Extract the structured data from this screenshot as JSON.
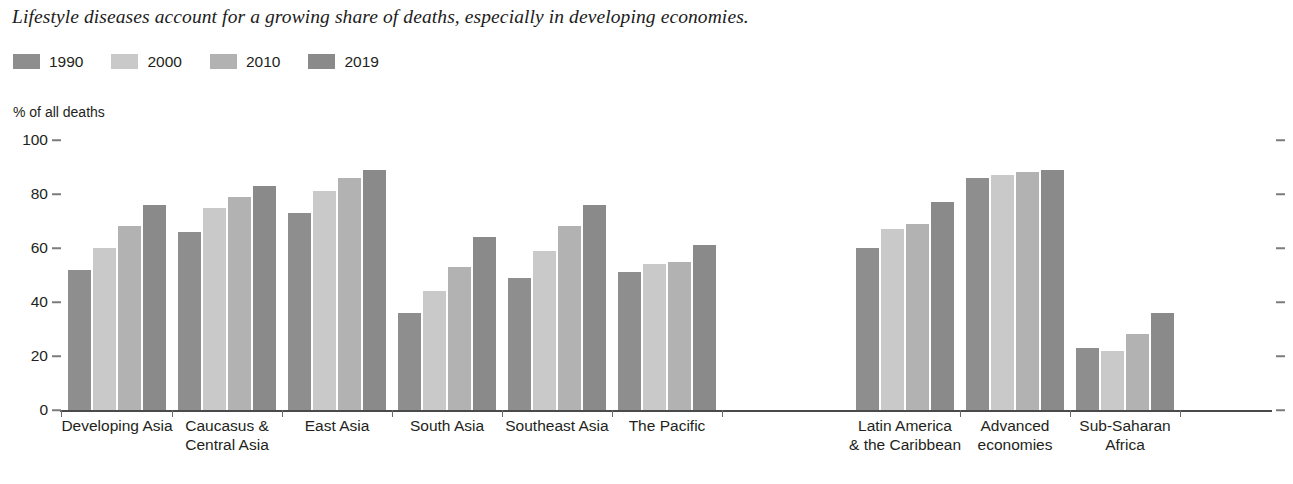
{
  "headline": "Lifestyle diseases account for a growing share of deaths, especially in developing economies.",
  "axis_title": "% of all deaths",
  "legend": {
    "items": [
      {
        "label": "1990",
        "color": "#8e8e8e"
      },
      {
        "label": "2000",
        "color": "#c9c9c9"
      },
      {
        "label": "2010",
        "color": "#b2b2b2"
      },
      {
        "label": "2019",
        "color": "#8a8a8a"
      }
    ]
  },
  "chart_data": {
    "type": "bar",
    "title": "Lifestyle diseases account for a growing share of deaths, especially in developing economies.",
    "xlabel": "",
    "ylabel": "% of all deaths",
    "ylim": [
      0,
      100
    ],
    "yticks": [
      0,
      20,
      40,
      60,
      80,
      100
    ],
    "grid": false,
    "legend_position": "top-left",
    "categories": [
      "Developing Asia",
      "Caucasus &\nCentral Asia",
      "East Asia",
      "South Asia",
      "Southeast Asia",
      "The Pacific",
      "Latin America\n& the Caribbean",
      "Advanced\neconomies",
      "Sub-Saharan\nAfrica"
    ],
    "category_lines": [
      [
        "Developing Asia"
      ],
      [
        "Caucasus &",
        "Central Asia"
      ],
      [
        "East Asia"
      ],
      [
        "South Asia"
      ],
      [
        "Southeast Asia"
      ],
      [
        "The Pacific"
      ],
      [
        "Latin America",
        "& the Caribbean"
      ],
      [
        "Advanced",
        "economies"
      ],
      [
        "Sub-Saharan",
        "Africa"
      ]
    ],
    "series": [
      {
        "name": "1990",
        "color": "#8e8e8e",
        "values": [
          52,
          66,
          73,
          36,
          49,
          51,
          60,
          86,
          23
        ]
      },
      {
        "name": "2000",
        "color": "#c9c9c9",
        "values": [
          60,
          75,
          81,
          44,
          59,
          54,
          67,
          87,
          22
        ]
      },
      {
        "name": "2010",
        "color": "#b2b2b2",
        "values": [
          68,
          79,
          86,
          53,
          68,
          55,
          69,
          88,
          28
        ]
      },
      {
        "name": "2019",
        "color": "#8a8a8a",
        "values": [
          76,
          83,
          89,
          64,
          76,
          61,
          77,
          89,
          36
        ]
      }
    ]
  }
}
